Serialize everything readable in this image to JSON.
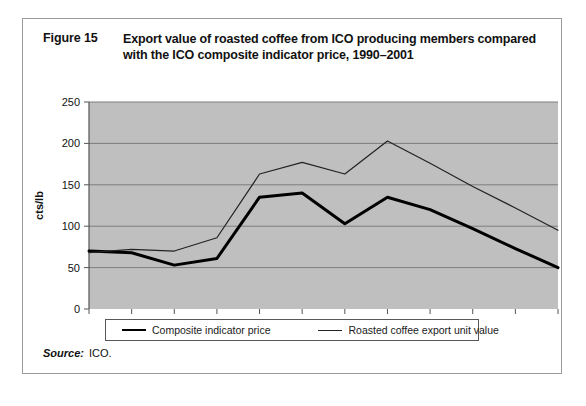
{
  "figure": {
    "number": "Figure 15",
    "title_line1": "Export value of roasted coffee from ICO producing members compared",
    "title_line2": "with the ICO composite indicator price, 1990–2001"
  },
  "source": {
    "label": "Source:",
    "value": "ICO."
  },
  "legend": {
    "entries": [
      {
        "label": "Composite indicator price",
        "style": "thick",
        "color": "#000000"
      },
      {
        "label": "Roasted coffee export unit value",
        "style": "thin",
        "color": "#222222"
      }
    ]
  },
  "colors": {
    "plot_background": "#bfbfbf",
    "gridline": "#7d7d7d",
    "axis": "#555555",
    "frame": "#9a9a9a",
    "series_thick": "#000000",
    "series_thin": "#222222"
  },
  "chart_data": {
    "type": "line",
    "title": "Export value of roasted coffee from ICO producing members compared with the ICO composite indicator price, 1990–2001",
    "xlabel": "",
    "ylabel": "cts/lb",
    "x": [
      1990,
      1991,
      1992,
      1993,
      1994,
      1995,
      1996,
      1997,
      1998,
      1999,
      2000,
      2001
    ],
    "categories": [
      "1990",
      "1991",
      "1992",
      "1993",
      "1994",
      "1995",
      "1996",
      "1997",
      "1998",
      "1999",
      "2000",
      "2001"
    ],
    "ylim": [
      0,
      250
    ],
    "yticks": [
      0,
      50,
      100,
      150,
      200,
      250
    ],
    "ytick_labels": [
      "0",
      "50",
      "100",
      "150",
      "200",
      "250"
    ],
    "grid": "horizontal",
    "legend_position": "bottom",
    "series": [
      {
        "name": "Composite indicator price",
        "style": "thick",
        "color": "#000000",
        "values": [
          70,
          68,
          53,
          61,
          135,
          140,
          103,
          135,
          120,
          97,
          73,
          50
        ]
      },
      {
        "name": "Roasted coffee export unit value",
        "style": "thin",
        "color": "#222222",
        "values": [
          68,
          72,
          70,
          86,
          163,
          177,
          163,
          203,
          176,
          148,
          122,
          95
        ]
      }
    ]
  }
}
